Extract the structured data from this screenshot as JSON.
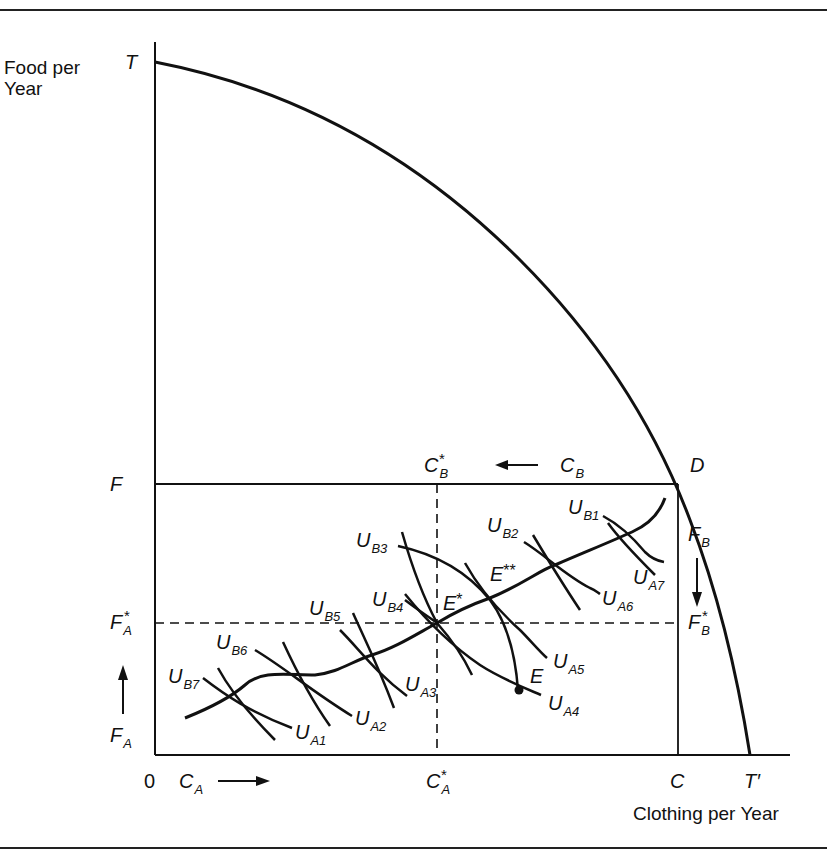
{
  "figure": {
    "y_axis_title_line1": "Food per",
    "y_axis_title_line2": "Year",
    "x_axis_title": "Clothing per Year",
    "origin_label": "0"
  },
  "points": {
    "T": "T",
    "T_prime": "T′",
    "D": "D",
    "E": "E",
    "E_star": "E",
    "E_star_mark": "*",
    "E_double_star": "E",
    "E_double_star_mark": "**"
  },
  "axis_labels": {
    "F": "F",
    "C": "C",
    "F_A_star": {
      "main": "F",
      "sub": "A",
      "sup": "*"
    },
    "F_A": {
      "main": "F",
      "sub": "A"
    },
    "C_A": {
      "main": "C",
      "sub": "A"
    },
    "C_A_star": {
      "main": "C",
      "sub": "A",
      "sup": "*"
    },
    "C_B": {
      "main": "C",
      "sub": "B"
    },
    "C_B_star": {
      "main": "C",
      "sub": "B",
      "sup": "*"
    },
    "F_B": {
      "main": "F",
      "sub": "B"
    },
    "F_B_star": {
      "main": "F",
      "sub": "B",
      "sup": "*"
    }
  },
  "indifference_curves": {
    "A": [
      {
        "main": "U",
        "sub": "A1"
      },
      {
        "main": "U",
        "sub": "A2"
      },
      {
        "main": "U",
        "sub": "A3"
      },
      {
        "main": "U",
        "sub": "A4"
      },
      {
        "main": "U",
        "sub": "A5"
      },
      {
        "main": "U",
        "sub": "A6"
      },
      {
        "main": "U",
        "sub": "A7"
      }
    ],
    "B": [
      {
        "main": "U",
        "sub": "B1"
      },
      {
        "main": "U",
        "sub": "B2"
      },
      {
        "main": "U",
        "sub": "B3"
      },
      {
        "main": "U",
        "sub": "B4"
      },
      {
        "main": "U",
        "sub": "B5"
      },
      {
        "main": "U",
        "sub": "B6"
      },
      {
        "main": "U",
        "sub": "B7"
      }
    ]
  },
  "colors": {
    "ink": "#111111",
    "background": "#ffffff"
  }
}
